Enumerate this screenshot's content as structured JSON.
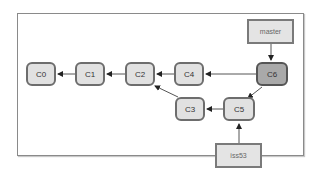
{
  "diagram": {
    "commits": [
      {
        "id": "C0",
        "label": "C0"
      },
      {
        "id": "C1",
        "label": "C1"
      },
      {
        "id": "C2",
        "label": "C2"
      },
      {
        "id": "C3",
        "label": "C3"
      },
      {
        "id": "C4",
        "label": "C4"
      },
      {
        "id": "C5",
        "label": "C5"
      },
      {
        "id": "C6",
        "label": "C6",
        "highlighted": true
      }
    ],
    "refs": [
      {
        "name": "master",
        "label": "master",
        "points_to": "C6"
      },
      {
        "name": "iss53",
        "label": "iss53",
        "points_to": "C5"
      }
    ],
    "edges": [
      {
        "from": "C1",
        "to": "C0"
      },
      {
        "from": "C2",
        "to": "C1"
      },
      {
        "from": "C4",
        "to": "C2"
      },
      {
        "from": "C3",
        "to": "C2"
      },
      {
        "from": "C6",
        "to": "C4"
      },
      {
        "from": "C6",
        "to": "C5"
      },
      {
        "from": "C5",
        "to": "C3"
      }
    ],
    "colors": {
      "node_fill": "#e1e1e1",
      "head_fill": "#a9a9a9",
      "border": "#6d6d6d",
      "ref_fill": "#e4e4e4"
    }
  }
}
